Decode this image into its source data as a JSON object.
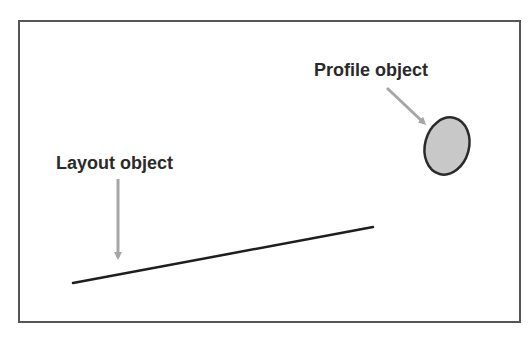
{
  "diagram": {
    "labels": {
      "profile_object": "Profile object",
      "layout_object": "Layout object"
    },
    "shapes": {
      "profile_ellipse": {
        "cx": 447,
        "cy": 146,
        "rx": 22,
        "ry": 29,
        "rotate": 15,
        "fill": "#c8c8c8",
        "stroke": "#2a2a2a"
      },
      "layout_line": {
        "x1": 73,
        "y1": 283,
        "x2": 373,
        "y2": 227,
        "stroke": "#1e1e1e"
      },
      "profile_arrow": {
        "x1": 387,
        "y1": 88,
        "x2": 428,
        "y2": 127,
        "color": "#a6a6a6"
      },
      "layout_arrow": {
        "x1": 118,
        "y1": 179,
        "x2": 118,
        "y2": 263,
        "color": "#a6a6a6"
      }
    },
    "frame_border_color": "#555555"
  }
}
